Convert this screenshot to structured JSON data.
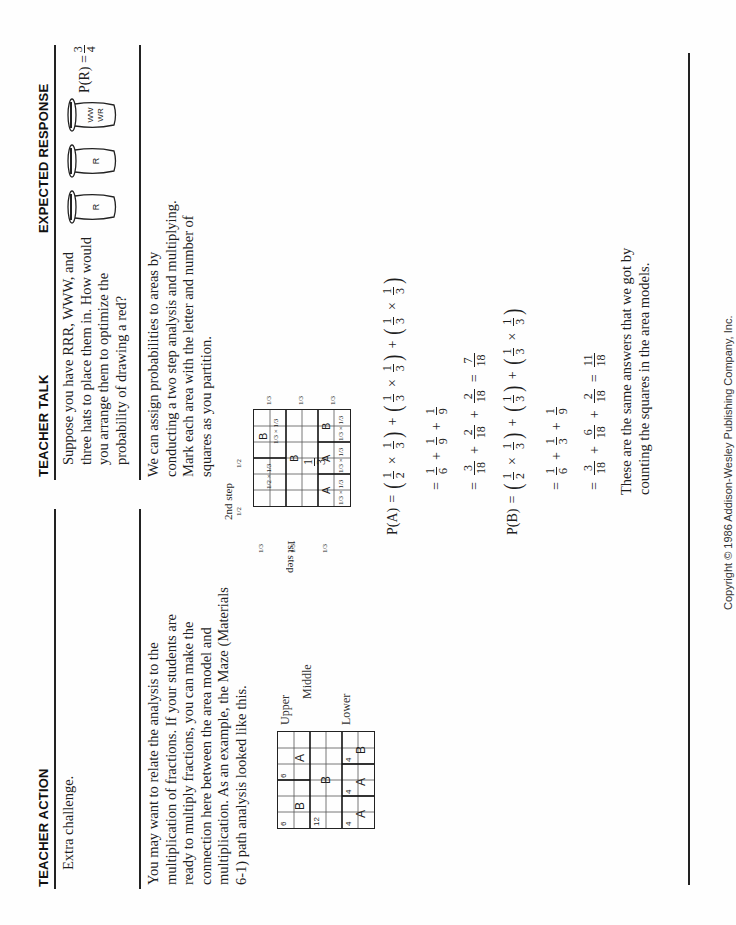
{
  "headers": {
    "teacher_action": "TEACHER ACTION",
    "teacher_talk": "TEACHER TALK",
    "expected_response": "EXPECTED RESPONSE"
  },
  "row1": {
    "action": "Extra challenge.",
    "talk": "Suppose you have RRR, WWW, and three hats to place them in. How would you arrange them to optimize the probability of drawing a red?",
    "response": {
      "hats": [
        {
          "label": "R"
        },
        {
          "label": "R"
        },
        {
          "label_line1": "WW",
          "label_line2": "WR"
        }
      ],
      "result_lhs": "P(R) =",
      "result_num": "3",
      "result_den": "4"
    }
  },
  "row2": {
    "action": "You may want to relate the analysis to the multiplication of fractions. If your students are ready to multiply fractions, you can make the connection here between the area model and multiplication. As an example, the Maze (Materials 6-1) path analysis looked like this.",
    "maze": {
      "bands": [
        "Upper",
        "Middle",
        "Lower"
      ],
      "upper": [
        {
          "count": "6",
          "letter": "B"
        },
        {
          "count": "6",
          "letter": "A"
        }
      ],
      "middle": [
        {
          "count": "12",
          "letter": "B"
        }
      ],
      "lower": [
        {
          "count": "4",
          "letter": "A"
        },
        {
          "count": "4",
          "letter": "A"
        },
        {
          "count": "4",
          "letter": "B"
        }
      ]
    },
    "talk_intro": "We can assign probabilities to areas by conducting a two step analysis and multiplying. Mark each area with the letter and number of squares as you partition.",
    "area_model": {
      "top_label": "2nd step",
      "side_label": "1st step",
      "top_fractions": [
        "1/2",
        "1/2"
      ],
      "side_fractions": [
        "1/3",
        "1/3",
        "1/3"
      ],
      "bottom_fractions": [
        "1/3",
        "1/3",
        "1/3"
      ],
      "cells": [
        {
          "band": "upper",
          "left": "1/2 × 1/3",
          "right_letter": "B",
          "right_product": "1/3 × 1/3"
        },
        {
          "band": "middle",
          "letter": "B",
          "product_num": "1",
          "product_den": "3"
        },
        {
          "band": "lower",
          "left_letter": "A",
          "left_product": "1/3 × 1/3",
          "mid_letter": "A",
          "mid_product": "1/3 × 1/3",
          "right_letter": "B",
          "right_product": "1/3 × 1/3"
        }
      ]
    },
    "equations": {
      "pa_label": "P(A)",
      "pb_label": "P(B)",
      "pa_line1": [
        [
          "1",
          "2"
        ],
        [
          "1",
          "3"
        ],
        [
          "1",
          "3"
        ],
        [
          "1",
          "3"
        ],
        [
          "1",
          "3"
        ],
        [
          "1",
          "3"
        ]
      ],
      "pa_line2": [
        [
          "1",
          "6"
        ],
        [
          "1",
          "9"
        ],
        [
          "1",
          "9"
        ]
      ],
      "pa_line3": [
        [
          "3",
          "18"
        ],
        [
          "2",
          "18"
        ],
        [
          "2",
          "18"
        ]
      ],
      "pa_result": [
        "7",
        "18"
      ],
      "pb_line1_a": [
        [
          "1",
          "2"
        ],
        [
          "1",
          "3"
        ]
      ],
      "pb_line1_b": [
        "1",
        "3"
      ],
      "pb_line1_c": [
        [
          "1",
          "3"
        ],
        [
          "1",
          "3"
        ]
      ],
      "pb_line2": [
        [
          "1",
          "6"
        ],
        [
          "1",
          "3"
        ],
        [
          "1",
          "9"
        ]
      ],
      "pb_line3": [
        [
          "3",
          "18"
        ],
        [
          "6",
          "18"
        ],
        [
          "2",
          "18"
        ]
      ],
      "pb_result": [
        "11",
        "18"
      ]
    },
    "conclusion": "These are the same answers that we got by counting the squares in the area models."
  },
  "footer": {
    "copyright": "Copyright © 1986 Addison-Wesley Publishing Company, Inc."
  }
}
